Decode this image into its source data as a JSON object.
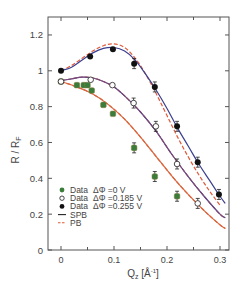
{
  "chart_data": {
    "type": "scatter",
    "title": "",
    "xlabel": "Q_z [Å^-1]",
    "ylabel": "R / R_F",
    "xlim": [
      -0.015,
      0.315
    ],
    "ylim": [
      0,
      1.3
    ],
    "xticks": [
      0,
      0.1,
      0.2,
      0.3
    ],
    "xtick_labels": [
      "0",
      "0.1",
      "0.2",
      "0.3"
    ],
    "yticks": [
      0,
      0.2,
      0.4,
      0.6,
      0.8,
      1,
      1.2
    ],
    "ytick_labels": [
      "0",
      "0.2",
      "0.4",
      "0.6",
      "0.8",
      "1",
      "1.2"
    ],
    "grid": false,
    "legend_position": "lower left",
    "series": [
      {
        "name": "Data ΔΦ =0 V",
        "marker": "filled-circle",
        "color": "#3a7d3a",
        "x": [
          0,
          0.03,
          0.043,
          0.05,
          0.058,
          0.08,
          0.098,
          0.138,
          0.177,
          0.219
        ],
        "y": [
          0.94,
          0.92,
          0.92,
          0.92,
          0.89,
          0.81,
          0.76,
          0.57,
          0.41,
          0.3
        ]
      },
      {
        "name": "Data ΔΦ =0.185 V",
        "marker": "open-circle",
        "color": "#222222",
        "x": [
          0,
          0.056,
          0.097,
          0.137,
          0.179,
          0.219,
          0.258
        ],
        "y": [
          0.94,
          0.95,
          0.92,
          0.82,
          0.69,
          0.48,
          0.26
        ]
      },
      {
        "name": "Data ΔΦ =0.255 V",
        "marker": "filled-circle",
        "color": "#111111",
        "x": [
          0,
          0.055,
          0.098,
          0.138,
          0.177,
          0.219,
          0.258,
          0.298
        ],
        "y": [
          1.0,
          1.08,
          1.12,
          1.04,
          0.91,
          0.69,
          0.49,
          0.31
        ]
      },
      {
        "name": "SPB",
        "style": "solid-line",
        "color": "#3b3f8f",
        "curves": [
          {
            "x": [
              0,
              0.03,
              0.06,
              0.09,
              0.12,
              0.15,
              0.18,
              0.21,
              0.24,
              0.27,
              0.3,
              0.31
            ],
            "y": [
              0.94,
              0.91,
              0.87,
              0.81,
              0.73,
              0.63,
              0.52,
              0.41,
              0.31,
              0.22,
              0.14,
              0.12
            ]
          },
          {
            "x": [
              0,
              0.02,
              0.04,
              0.06,
              0.08,
              0.1,
              0.12,
              0.15,
              0.18,
              0.21,
              0.24,
              0.27,
              0.3,
              0.31
            ],
            "y": [
              0.945,
              0.955,
              0.965,
              0.96,
              0.94,
              0.91,
              0.86,
              0.77,
              0.66,
              0.53,
              0.41,
              0.3,
              0.2,
              0.18
            ]
          },
          {
            "x": [
              0,
              0.02,
              0.04,
              0.06,
              0.08,
              0.1,
              0.12,
              0.14,
              0.16,
              0.18,
              0.2,
              0.22,
              0.24,
              0.26,
              0.28,
              0.3,
              0.31
            ],
            "y": [
              1.0,
              1.02,
              1.06,
              1.1,
              1.125,
              1.13,
              1.11,
              1.06,
              0.98,
              0.89,
              0.79,
              0.68,
              0.58,
              0.48,
              0.39,
              0.3,
              0.26
            ]
          }
        ]
      },
      {
        "name": "PB",
        "style": "dashed-line",
        "color": "#e05a3a",
        "curves": [
          {
            "x": [
              0,
              0.03,
              0.06,
              0.09,
              0.12,
              0.15,
              0.18,
              0.21,
              0.24,
              0.27,
              0.3,
              0.31
            ],
            "y": [
              0.94,
              0.91,
              0.87,
              0.81,
              0.73,
              0.63,
              0.52,
              0.41,
              0.31,
              0.22,
              0.14,
              0.12
            ]
          },
          {
            "x": [
              0,
              0.02,
              0.04,
              0.06,
              0.08,
              0.1,
              0.12,
              0.15,
              0.18,
              0.21,
              0.24,
              0.27,
              0.3,
              0.31
            ],
            "y": [
              0.945,
              0.955,
              0.965,
              0.96,
              0.94,
              0.91,
              0.86,
              0.77,
              0.66,
              0.53,
              0.41,
              0.3,
              0.2,
              0.18
            ]
          },
          {
            "x": [
              0,
              0.02,
              0.04,
              0.06,
              0.08,
              0.1,
              0.12,
              0.14,
              0.16,
              0.18,
              0.2,
              0.22,
              0.24,
              0.26,
              0.28,
              0.3
            ],
            "y": [
              1.0,
              1.03,
              1.07,
              1.11,
              1.14,
              1.15,
              1.13,
              1.07,
              0.98,
              0.87,
              0.75,
              0.63,
              0.52,
              0.42,
              0.33,
              0.25
            ]
          }
        ]
      }
    ]
  },
  "legend": {
    "items": [
      {
        "label": "Data",
        "param": "ΔΦ =0 V"
      },
      {
        "label": "Data",
        "param": "ΔΦ =0.185 V"
      },
      {
        "label": "Data",
        "param": "ΔΦ =0.255 V"
      },
      {
        "label": "SPB",
        "param": ""
      },
      {
        "label": "PB",
        "param": ""
      }
    ]
  },
  "axes": {
    "xlabel_main": "Q",
    "xlabel_sub": "z",
    "xlabel_unit": "[Å",
    "xlabel_unit_sup": "-1",
    "xlabel_unit_end": "]",
    "ylabel_main": "R / R",
    "ylabel_sub": "F"
  }
}
